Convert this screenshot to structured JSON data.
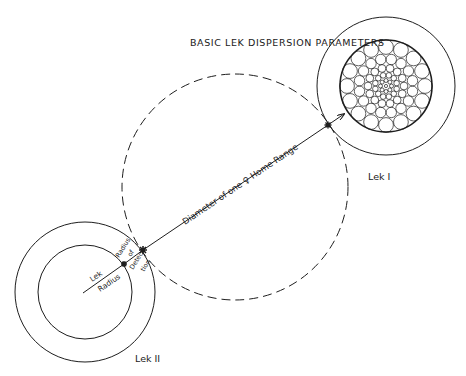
{
  "title": "BASIC LEK DISPERSION PARAMETERS",
  "colors": {
    "ink": "#1e1e1e",
    "background": "#ffffff"
  },
  "lek1": {
    "label": "Lek I",
    "center": [
      386,
      86
    ],
    "outer_radius": 69,
    "inner_radius": 46,
    "packing_rings": [
      {
        "radius": 39,
        "count": 16,
        "size": 7.4
      },
      {
        "radius": 27,
        "count": 16,
        "size": 5.2
      },
      {
        "radius": 18,
        "count": 14,
        "size": 3.9
      },
      {
        "radius": 11,
        "count": 12,
        "size": 2.8
      },
      {
        "radius": 5.5,
        "count": 8,
        "size": 2.0
      },
      {
        "radius": 0,
        "count": 1,
        "size": 1.6
      }
    ]
  },
  "lek2": {
    "label": "Lek II",
    "center": [
      85,
      292
    ],
    "outer_radius": 70,
    "inner_radius": 47
  },
  "home_range": {
    "center": [
      235,
      187
    ],
    "radius": 113,
    "label_pre": "Diameter of one",
    "female_symbol": "♀",
    "label_post": "Home Range"
  },
  "labels": {
    "lek_radius_top": "Lek",
    "lek_radius_bottom": "Radius",
    "detection_top_1": "Radius",
    "detection_top_2": "of",
    "detection_bottom_1": "Detec-",
    "detection_bottom_2": "tion"
  }
}
